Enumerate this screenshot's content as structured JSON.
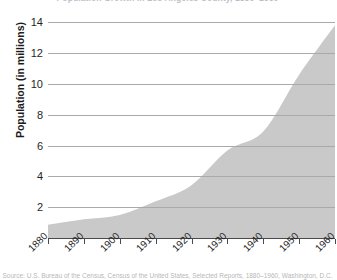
{
  "chart_data": {
    "type": "area",
    "title": "Population Growth in Los Angeles County, 1880–1960",
    "xlabel": "",
    "ylabel": "Population (in millions)",
    "source_caption": "Source: U.S. Bureau of the Census, Census of the United States, Selected Reports, 1880–1960, Washington, D.C.",
    "x": [
      1880,
      1890,
      1900,
      1910,
      1920,
      1930,
      1940,
      1950,
      1960
    ],
    "xtick_labels": [
      "1880",
      "1890",
      "1900",
      "1910",
      "1920",
      "1930",
      "1940",
      "1950",
      "1960"
    ],
    "values": [
      0.86,
      1.21,
      1.49,
      2.38,
      3.43,
      5.68,
      6.91,
      10.59,
      13.8
    ],
    "ytick_labels": [
      "14",
      "12",
      "10",
      "8",
      "6",
      "4",
      "2"
    ],
    "yticks": [
      14,
      12,
      10,
      8,
      6,
      4,
      2
    ],
    "ylim": [
      0,
      14.6
    ],
    "xlim": [
      1880,
      1960
    ],
    "grid": "horizontal",
    "legend": "none",
    "series": [
      {
        "name": "Population",
        "fill_color": "#c9c9c9",
        "values": [
          0.86,
          1.21,
          1.49,
          2.38,
          3.43,
          5.68,
          6.91,
          10.59,
          13.8
        ]
      }
    ],
    "colors": {
      "area_fill": "#c9c9c9",
      "gridline": "#cfcfcf",
      "gridline_over_fill": "#9e9e9e",
      "axis": "#4a4a4a",
      "text": "#1f1f1f"
    }
  }
}
